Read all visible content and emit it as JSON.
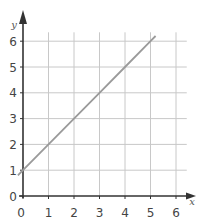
{
  "chart_data": {
    "type": "line",
    "title": "",
    "xlabel": "x",
    "ylabel": "y",
    "xlim": [
      0,
      6.5
    ],
    "ylim": [
      0,
      6.5
    ],
    "grid": true,
    "x_ticks": [
      "0",
      "1",
      "2",
      "3",
      "4",
      "5",
      "6"
    ],
    "y_ticks": [
      "0",
      "1",
      "2",
      "3",
      "4",
      "5",
      "6"
    ],
    "series": [
      {
        "name": "y = x + 1",
        "x": [
          -0.2,
          0,
          1,
          2,
          3,
          4,
          5,
          5.2
        ],
        "y": [
          0.8,
          1,
          2,
          3,
          4,
          5,
          6,
          6.2
        ]
      }
    ],
    "legend": null
  },
  "colors": {
    "grid": "#c8c8c8",
    "axis": "#333333",
    "line": "#9a9a9a",
    "text": "#444444"
  }
}
